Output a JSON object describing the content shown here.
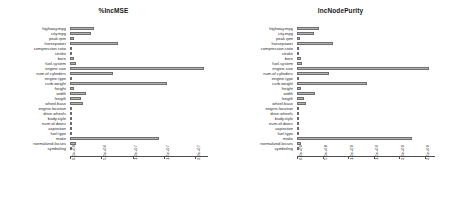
{
  "figure": {
    "kind": "variable-importance-plot",
    "panel_count": 2,
    "background": "#ffffff",
    "bar_fill": "#b3b3b3",
    "bar_stroke": "#6e6e6e",
    "axis_color": "#4d4d4d"
  },
  "variables": [
    "highway.mpg",
    "city.mpg",
    "peak.rpm",
    "horsepower",
    "compression.ratio",
    "stroke",
    "bore",
    "fuel.system",
    "engine.size",
    "num.of.cylinders",
    "engine.type",
    "curb.weight",
    "height",
    "width",
    "length",
    "wheel.base",
    "engine.location",
    "drive.wheels",
    "body.style",
    "num.of.doors",
    "aspiration",
    "fuel.type",
    "make",
    "normalized.losses",
    "symboling"
  ],
  "chart_data": [
    {
      "type": "bar",
      "orientation": "horizontal",
      "title": "%IncMSE",
      "xlabel": "",
      "ylabel": "",
      "xlim": [
        0,
        22000000
      ],
      "grid": false,
      "legend": null,
      "tick_labels": [
        "0.0e+00",
        "5.0e+06",
        "1.0e+07",
        "1.5e+07",
        "2.0e+07"
      ],
      "tick_values": [
        0,
        5000000,
        10000000,
        15000000,
        20000000
      ],
      "categories": [
        "highway.mpg",
        "city.mpg",
        "peak.rpm",
        "horsepower",
        "compression.ratio",
        "stroke",
        "bore",
        "fuel.system",
        "engine.size",
        "num.of.cylinders",
        "engine.type",
        "curb.weight",
        "height",
        "width",
        "length",
        "wheel.base",
        "engine.location",
        "drive.wheels",
        "body.style",
        "num.of.doors",
        "aspiration",
        "fuel.type",
        "make",
        "normalized.losses",
        "symboling"
      ],
      "values": [
        3900000,
        3300000,
        600000,
        7600000,
        200000,
        250000,
        700000,
        900000,
        21300000,
        6900000,
        300000,
        15500000,
        600000,
        2600000,
        1700000,
        2100000,
        120000,
        350000,
        250000,
        100000,
        200000,
        150000,
        14200000,
        900000,
        200000
      ]
    },
    {
      "type": "bar",
      "orientation": "horizontal",
      "title": "IncNodePurity",
      "xlabel": "",
      "ylabel": "",
      "xlim": [
        0,
        2700000000
      ],
      "grid": false,
      "legend": null,
      "tick_labels": [
        "0.0e+00",
        "5.0e+08",
        "1.0e+09",
        "1.5e+09",
        "2.0e+09",
        "2.5e+09"
      ],
      "tick_values": [
        0,
        500000000,
        1000000000,
        1500000000,
        2000000000,
        2500000000
      ],
      "categories": [
        "highway.mpg",
        "city.mpg",
        "peak.rpm",
        "horsepower",
        "compression.ratio",
        "stroke",
        "bore",
        "fuel.system",
        "engine.size",
        "num.of.cylinders",
        "engine.type",
        "curb.weight",
        "height",
        "width",
        "length",
        "wheel.base",
        "engine.location",
        "drive.wheels",
        "body.style",
        "num.of.doors",
        "aspiration",
        "fuel.type",
        "make",
        "normalized.losses",
        "symboling"
      ],
      "values": [
        440000000,
        330000000,
        55000000,
        700000000,
        38000000,
        30000000,
        75000000,
        95000000,
        2580000000,
        620000000,
        22000000,
        1360000000,
        70000000,
        360000000,
        130000000,
        185000000,
        12000000,
        40000000,
        28000000,
        14000000,
        18000000,
        10000000,
        2250000000,
        75000000,
        20000000
      ]
    }
  ]
}
